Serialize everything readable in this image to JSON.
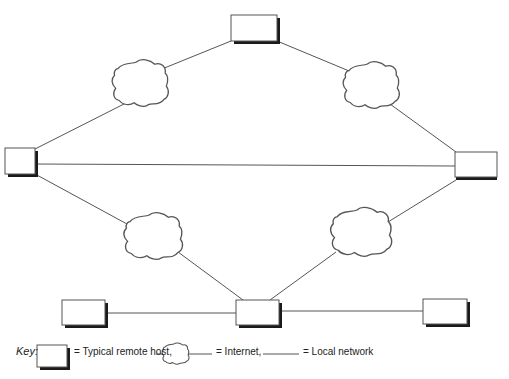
{
  "diagram": {
    "type": "network-topology",
    "colors": {
      "line": "#555555",
      "box_border": "#555555",
      "box_shadow": "#1a1a1a",
      "background": "#ffffff"
    },
    "nodes": [
      {
        "id": "host-top",
        "kind": "remote-host",
        "x": 231,
        "y": 15,
        "w": 46,
        "h": 26
      },
      {
        "id": "host-left",
        "kind": "remote-host",
        "x": 5,
        "y": 148,
        "w": 30,
        "h": 26
      },
      {
        "id": "host-right",
        "kind": "remote-host",
        "x": 455,
        "y": 152,
        "w": 42,
        "h": 27
      },
      {
        "id": "host-bottom-left",
        "kind": "remote-host",
        "x": 62,
        "y": 300,
        "w": 43,
        "h": 25
      },
      {
        "id": "host-bottom-center",
        "kind": "remote-host",
        "x": 236,
        "y": 300,
        "w": 43,
        "h": 25
      },
      {
        "id": "host-bottom-right",
        "kind": "remote-host",
        "x": 423,
        "y": 299,
        "w": 44,
        "h": 25
      },
      {
        "id": "cloud-top-left",
        "kind": "internet",
        "cx": 141,
        "cy": 84
      },
      {
        "id": "cloud-top-right",
        "kind": "internet",
        "cx": 372,
        "cy": 86
      },
      {
        "id": "cloud-bottom-left",
        "kind": "internet",
        "cx": 154,
        "cy": 237
      },
      {
        "id": "cloud-bottom-right",
        "kind": "internet",
        "cx": 362,
        "cy": 233
      }
    ],
    "edges": [
      {
        "from": "host-top",
        "to": "cloud-top-left",
        "kind": "internet"
      },
      {
        "from": "cloud-top-left",
        "to": "host-left",
        "kind": "internet"
      },
      {
        "from": "host-top",
        "to": "cloud-top-right",
        "kind": "internet"
      },
      {
        "from": "cloud-top-right",
        "to": "host-right",
        "kind": "internet"
      },
      {
        "from": "host-left",
        "to": "host-right",
        "kind": "local"
      },
      {
        "from": "host-left",
        "to": "cloud-bottom-left",
        "kind": "internet"
      },
      {
        "from": "cloud-bottom-left",
        "to": "host-bottom-center",
        "kind": "internet"
      },
      {
        "from": "host-right",
        "to": "cloud-bottom-right",
        "kind": "internet"
      },
      {
        "from": "cloud-bottom-right",
        "to": "host-bottom-center",
        "kind": "internet"
      },
      {
        "from": "host-bottom-left",
        "to": "host-bottom-center",
        "kind": "local"
      },
      {
        "from": "host-bottom-center",
        "to": "host-bottom-right",
        "kind": "local"
      }
    ]
  },
  "key": {
    "label": "Key:",
    "host_text": "= Typical remote host,",
    "internet_text": "= Internet,",
    "local_text": "= Local network"
  }
}
